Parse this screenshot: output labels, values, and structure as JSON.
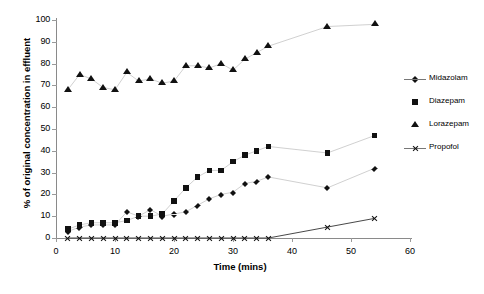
{
  "chart_data": {
    "type": "scatter",
    "title": "",
    "xlabel": "Time (mins)",
    "ylabel": "% of original concentration in effluent",
    "xlim": [
      0,
      60
    ],
    "ylim": [
      0,
      100
    ],
    "xticks": [
      0,
      10,
      20,
      30,
      40,
      50,
      60
    ],
    "yticks": [
      0,
      10,
      20,
      30,
      40,
      50,
      60,
      70,
      80,
      90,
      100
    ],
    "grid": false,
    "legend_position": "right",
    "series": [
      {
        "name": "Midazolam",
        "marker": "diamond",
        "x": [
          2,
          4,
          6,
          8,
          10,
          12,
          14,
          16,
          18,
          20,
          22,
          24,
          26,
          28,
          30,
          32,
          34,
          36,
          46,
          54
        ],
        "y": [
          3,
          5,
          6,
          6,
          6,
          12,
          10,
          13,
          10,
          11,
          12,
          15,
          18,
          20,
          21,
          25,
          26,
          28,
          23,
          32
        ]
      },
      {
        "name": "Diazepam",
        "marker": "square",
        "x": [
          2,
          4,
          6,
          8,
          10,
          12,
          14,
          16,
          18,
          20,
          22,
          24,
          26,
          28,
          30,
          32,
          34,
          36,
          46,
          54
        ],
        "y": [
          4,
          6,
          7,
          7,
          7,
          8,
          10,
          10,
          11,
          17,
          23,
          28,
          31,
          31,
          35,
          38,
          40,
          42,
          39,
          47
        ]
      },
      {
        "name": "Lorazepam",
        "marker": "triangle",
        "x": [
          2,
          4,
          6,
          8,
          10,
          12,
          14,
          16,
          18,
          20,
          22,
          24,
          26,
          28,
          30,
          32,
          34,
          36,
          46,
          54
        ],
        "y": [
          68,
          75,
          73,
          69,
          68,
          76,
          72,
          73,
          71,
          72,
          79,
          79,
          78,
          80,
          77,
          82,
          85,
          88,
          97,
          98
        ]
      },
      {
        "name": "Propofol",
        "marker": "x",
        "x": [
          2,
          4,
          6,
          8,
          10,
          12,
          14,
          16,
          18,
          20,
          22,
          24,
          26,
          28,
          30,
          32,
          34,
          36,
          46,
          54
        ],
        "y": [
          0,
          0,
          0,
          0,
          0,
          0,
          0,
          0,
          0,
          0,
          0,
          0,
          0,
          0,
          0,
          0,
          0,
          0,
          5,
          9
        ]
      }
    ]
  },
  "legend": {
    "items": [
      {
        "label": "Midazolam",
        "marker": "diamond"
      },
      {
        "label": "Diazepam",
        "marker": "square"
      },
      {
        "label": "Lorazepam",
        "marker": "triangle"
      },
      {
        "label": "Propofol",
        "marker": "x"
      }
    ]
  },
  "colors": {
    "marker": "#111111",
    "axis": "#8a8a8a",
    "connector": "#bbbbbb",
    "propofol_line": "#333333"
  }
}
